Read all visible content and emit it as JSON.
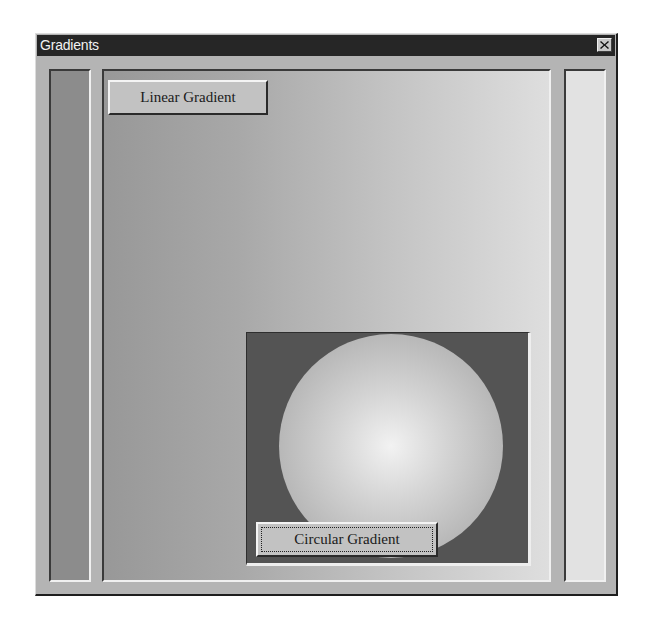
{
  "window": {
    "title": "Gradients",
    "close_icon": "close-icon"
  },
  "panels": {
    "left": {
      "fill": "#8c8c8c"
    },
    "main": {
      "gradient": "linear-horizontal",
      "from": "#989898",
      "to": "#dedede"
    },
    "right": {
      "fill": "#e2e2e2"
    },
    "circle": {
      "background": "#545454",
      "gradient": "radial",
      "center": "#f2f2f2",
      "edge": "#a2a2a2"
    }
  },
  "buttons": {
    "linear_gradient": "Linear Gradient",
    "circular_gradient": "Circular Gradient"
  },
  "focus": {
    "focused_button": "Circular Gradient"
  }
}
